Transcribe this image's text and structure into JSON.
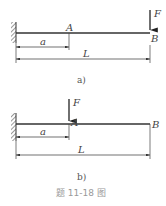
{
  "figures": [
    {
      "id": "a",
      "caption": "a)",
      "labels": {
        "force": "F",
        "pointA": "A",
        "pointB": "B",
        "dim_a": "a",
        "dim_L": "L"
      },
      "load_position": "B"
    },
    {
      "id": "b",
      "caption": "b)",
      "labels": {
        "force": "F",
        "pointA": "A",
        "pointB": "B",
        "dim_a": "a",
        "dim_L": "L"
      },
      "load_position": "A"
    }
  ],
  "title": "题 11-18 图"
}
